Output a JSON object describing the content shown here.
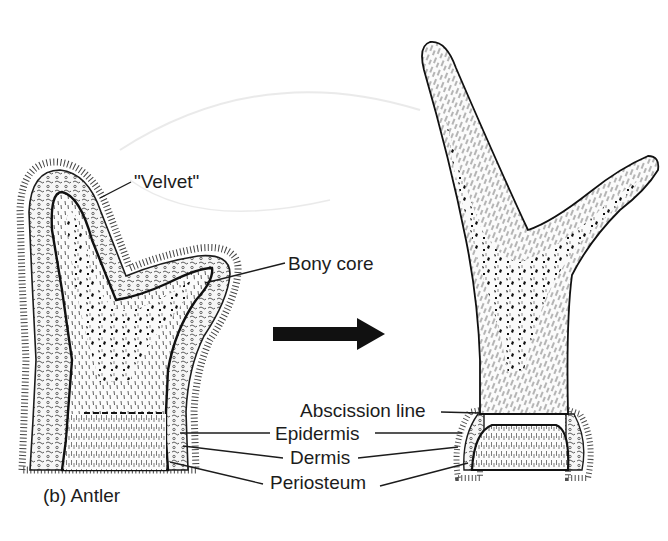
{
  "figure": {
    "caption": "(b) Antler",
    "labels": {
      "velvet": "\"Velvet\"",
      "bony_core": "Bony core",
      "abscission_line": "Abscission line",
      "epidermis": "Epidermis",
      "dermis": "Dermis",
      "periosteum": "Periosteum"
    },
    "panels": [
      {
        "name": "growing antler in velvet",
        "position": "left"
      },
      {
        "name": "mature antler with velvet shed",
        "position": "right"
      }
    ],
    "arrow": {
      "direction": "right",
      "meaning": "development from velvet to mature antler"
    },
    "colors": {
      "ink": "#1c1c1c",
      "background": "#ffffff"
    }
  }
}
